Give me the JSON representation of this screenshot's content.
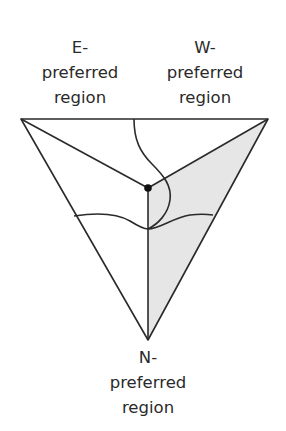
{
  "labels": {
    "east": {
      "line1": "E-",
      "line2": "preferred",
      "line3": "region"
    },
    "west": {
      "line1": "W-",
      "line2": "preferred",
      "line3": "region"
    },
    "north": {
      "line1": "N-",
      "line2": "preferred",
      "line3": "region"
    }
  },
  "colors": {
    "stroke": "#2a2a2a",
    "shaded_region": "#e6e6e6",
    "background": "#ffffff"
  },
  "geometry": {
    "vertices": {
      "top_left": [
        21,
        119
      ],
      "top_right": [
        268,
        119
      ],
      "bottom": [
        148,
        340
      ]
    },
    "center_point": [
      148,
      188
    ]
  }
}
